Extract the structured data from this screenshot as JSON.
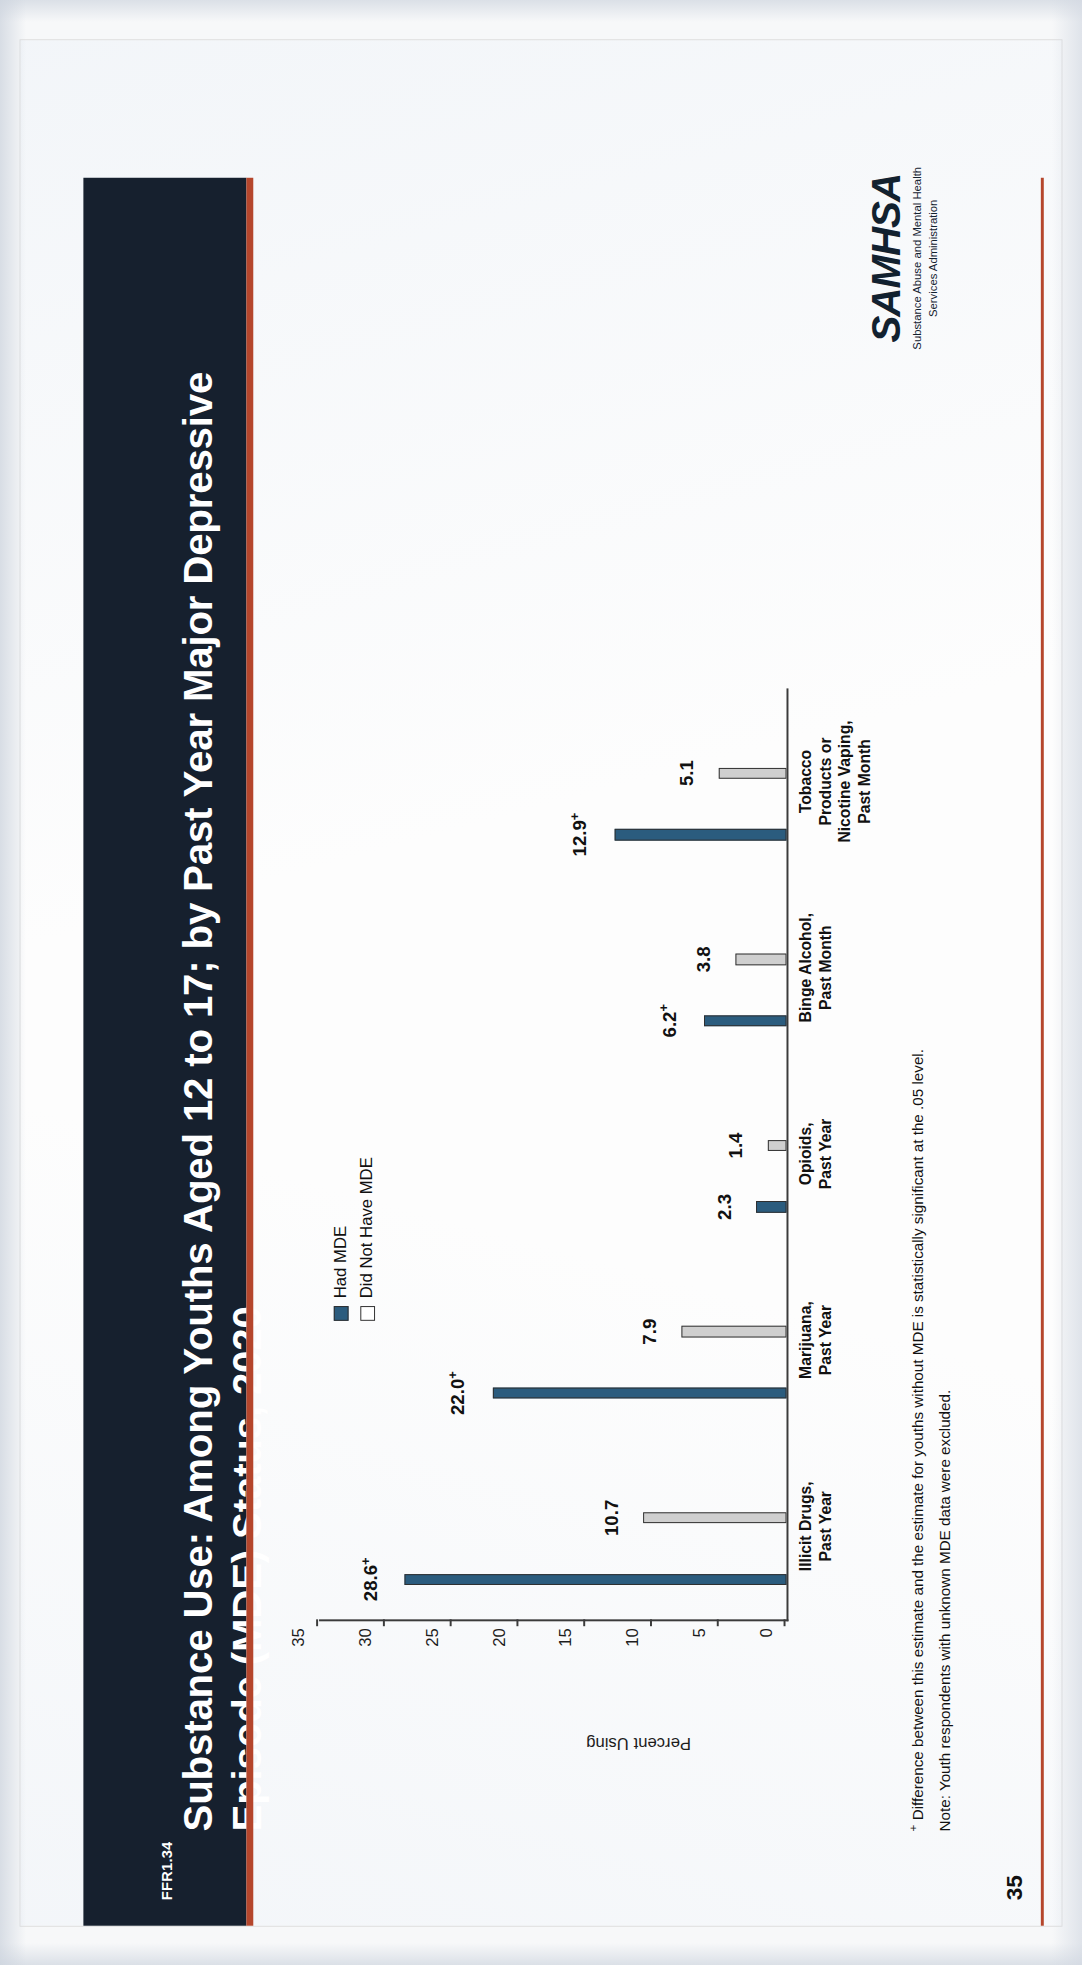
{
  "document": {
    "ffr_code": "FFR1.34",
    "title": "Substance Use: Among Youths Aged 12 to 17; by Past Year Major Depressive Episode (MDE) Status, 2020",
    "page_number": "35",
    "accent_color": "#b5462c",
    "banner_color": "#16202e"
  },
  "footnotes": {
    "significance": "Difference between this estimate and the estimate for youths without MDE is statistically significant at the .05 level.",
    "significance_marker": "+",
    "note": "Note: Youth respondents with unknown MDE data were excluded."
  },
  "logo": {
    "wordmark": "SAMHSA",
    "line1": "Substance Abuse and Mental Health",
    "line2": "Services Administration"
  },
  "chart_data": {
    "type": "bar",
    "title": "",
    "xlabel": "",
    "ylabel": "Percent Using",
    "ylim": [
      0,
      35
    ],
    "yticks": [
      0,
      5,
      10,
      15,
      20,
      25,
      30,
      35
    ],
    "grid": false,
    "legend_position": "top-right",
    "categories": [
      "Illicit Drugs,\nPast Year",
      "Marijuana,\nPast Year",
      "Opioids,\nPast Year",
      "Binge Alcohol,\nPast Month",
      "Tobacco\nProducts or\nNicotine Vaping,\nPast Month"
    ],
    "series": [
      {
        "name": "Had MDE",
        "color": "#2b5c7e",
        "values": [
          28.6,
          22.0,
          2.3,
          6.2,
          12.9
        ],
        "labels": [
          "28.6+",
          "22.0+",
          "2.3",
          "6.2+",
          "12.9+"
        ]
      },
      {
        "name": "Did Not Have MDE",
        "color": "#cfcfcf",
        "values": [
          10.7,
          7.9,
          1.4,
          3.8,
          5.1
        ],
        "labels": [
          "10.7",
          "7.9",
          "1.4",
          "3.8",
          "5.1"
        ]
      }
    ]
  }
}
